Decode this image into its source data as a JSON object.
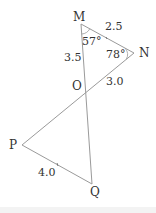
{
  "diagram": {
    "type": "geometry",
    "vertices": [
      {
        "name": "M"
      },
      {
        "name": "N"
      },
      {
        "name": "O"
      },
      {
        "name": "P"
      },
      {
        "name": "Q"
      }
    ],
    "segments": [
      {
        "from": "M",
        "to": "N",
        "length_label": "2.5"
      },
      {
        "from": "M",
        "to": "O",
        "length_label": "3.5"
      },
      {
        "from": "O",
        "to": "N",
        "length_label": "3.0"
      },
      {
        "from": "P",
        "to": "Q",
        "length_label": "4.0"
      },
      {
        "from": "O",
        "to": "P"
      },
      {
        "from": "O",
        "to": "Q"
      }
    ],
    "angles": [
      {
        "vertex": "M",
        "label": "57°"
      },
      {
        "vertex": "N",
        "label": "78°"
      }
    ],
    "labels": {
      "M": "M",
      "N": "N",
      "O": "O",
      "P": "P",
      "Q": "Q",
      "MN": "2.5",
      "MO": "3.5",
      "ON": "3.0",
      "PQ": "4.0",
      "angle_M": "57°",
      "angle_N": "78°"
    },
    "colors": {
      "line": "#9a9a9a",
      "text": "#333333"
    }
  }
}
